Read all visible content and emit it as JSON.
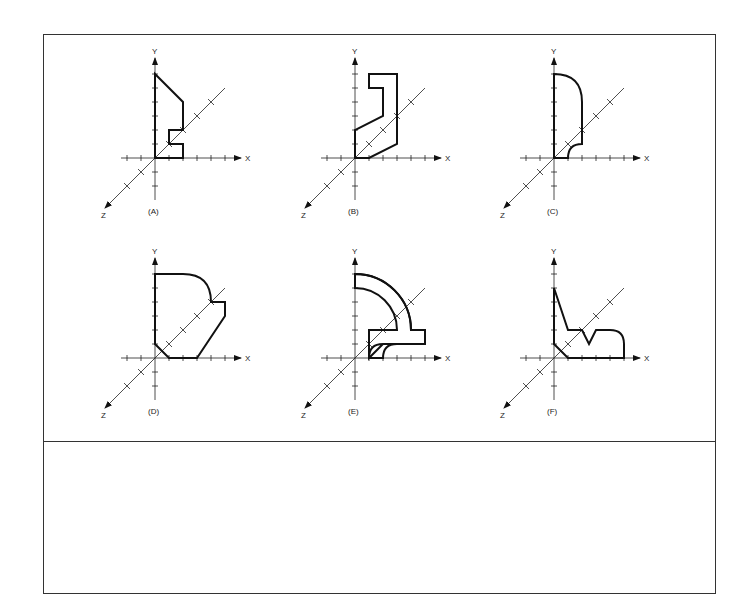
{
  "figure": {
    "axis_labels": {
      "x": "X",
      "y": "Y",
      "z": "Z"
    },
    "panels": [
      {
        "id": "A",
        "caption": "(A)"
      },
      {
        "id": "B",
        "caption": "(B)"
      },
      {
        "id": "C",
        "caption": "(C)"
      },
      {
        "id": "D",
        "caption": "(D)"
      },
      {
        "id": "E",
        "caption": "(E)"
      },
      {
        "id": "F",
        "caption": "(F)"
      }
    ]
  },
  "answer_area": {
    "content": ""
  }
}
